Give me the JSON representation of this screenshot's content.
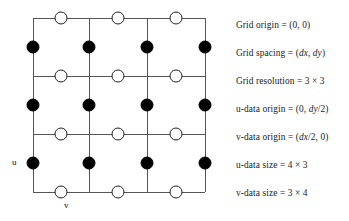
{
  "figure": {
    "type": "staggered-grid-diagram",
    "grid": {
      "x_lines": [
        33,
        89,
        147,
        205
      ],
      "y_lines": [
        18,
        76,
        134,
        192
      ],
      "line_color": "#555555",
      "line_width": 1
    },
    "u_nodes": {
      "marker": "filled-circle",
      "fill": "#000000",
      "stroke": "#000000",
      "radius": 6,
      "count": 12,
      "cx": [
        33,
        89,
        147,
        205
      ],
      "cy": [
        47,
        105,
        163
      ]
    },
    "v_nodes": {
      "marker": "open-circle",
      "fill": "#ffffff",
      "stroke": "#222222",
      "radius": 6,
      "count": 12,
      "cx": [
        61,
        118,
        176
      ],
      "cy": [
        18,
        76,
        134,
        192
      ]
    },
    "axis_labels": {
      "u": "u",
      "v": "v"
    }
  },
  "legend": {
    "lines": [
      {
        "label": "Grid origin = (0, 0)"
      },
      {
        "label": "Grid spacing = (dx, dy)"
      },
      {
        "label": "Grid resolution = 3 × 3"
      },
      {
        "label": "u-data origin = (0, dy/2)"
      },
      {
        "label": "v-data origin = (dx/2, 0)"
      },
      {
        "label": "u-data size = 4 × 3"
      },
      {
        "label": "v-data size = 3 × 4"
      }
    ],
    "line_tops": [
      20,
      48,
      76,
      104,
      132,
      160,
      188
    ]
  }
}
